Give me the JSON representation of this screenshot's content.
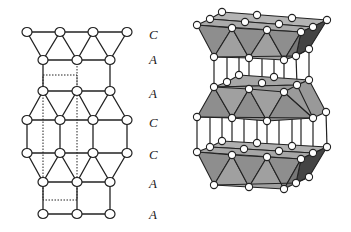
{
  "figure": {
    "left_panel": {
      "description": "2D projection of stacked layers with stacking sequence labels",
      "layer_labels": [
        {
          "text": "C",
          "y": 35
        },
        {
          "text": "A",
          "y": 60
        },
        {
          "text": "A",
          "y": 94
        },
        {
          "text": "C",
          "y": 123
        },
        {
          "text": "C",
          "y": 155
        },
        {
          "text": "A",
          "y": 184
        },
        {
          "text": "A",
          "y": 215
        }
      ],
      "unit_cell": "dotted rectangle"
    },
    "right_panel": {
      "description": "3D perspective view of three stacked octahedral layers connected by vertical bonds"
    },
    "colors": {
      "line": "#222222",
      "node_fill": "#ffffff",
      "face_light": "#a8a8a8",
      "face_mid": "#8c8c8c",
      "face_dark": "#555555",
      "label": "#222222"
    }
  }
}
